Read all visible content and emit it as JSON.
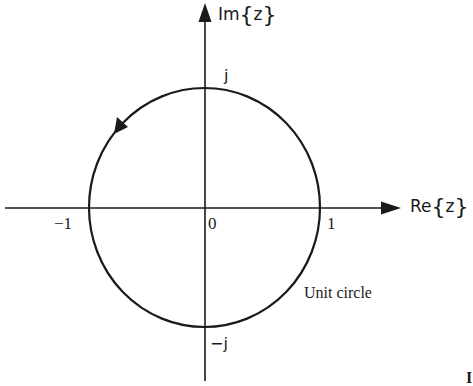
{
  "diagram": {
    "type": "complex-plane",
    "axes": {
      "horizontal": {
        "label_main": "Re",
        "label_var": "z"
      },
      "vertical": {
        "label_main": "Im",
        "label_var": "z"
      }
    },
    "ticks": {
      "origin": "0",
      "neg_one": "−1",
      "pos_one": "1",
      "pos_j": "j",
      "neg_j": "−j"
    },
    "circle": {
      "label": "Unit circle",
      "radius": 1,
      "direction": "counterclockwise"
    },
    "colors": {
      "ink": "#1a1a1a",
      "background": "#ffffff"
    },
    "corner_fragment": "I"
  }
}
